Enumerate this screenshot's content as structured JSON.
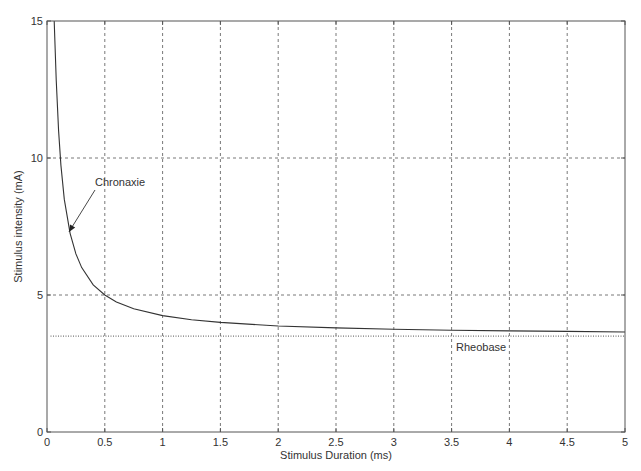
{
  "chart_data": {
    "type": "line",
    "title": "",
    "xlabel": "Stimulus Duration (ms)",
    "ylabel": "Stimulus intensity (mA)",
    "xlim": [
      0,
      5
    ],
    "ylim": [
      0,
      15
    ],
    "xticks": [
      0,
      0.5,
      1,
      1.5,
      2,
      2.5,
      3,
      3.5,
      4,
      4.5,
      5
    ],
    "xtick_labels": [
      "0",
      "0.5",
      "1",
      "1.5",
      "2",
      "2.5",
      "3",
      "3.5",
      "4",
      "4.5",
      "5"
    ],
    "yticks": [
      0,
      5,
      10,
      15
    ],
    "ytick_labels": [
      "0",
      "5",
      "10",
      "15"
    ],
    "grid": true,
    "grid_style": "dashed",
    "legend": null,
    "series": [
      {
        "name": "Strength-duration curve",
        "style": "solid",
        "color": "#333333",
        "x": [
          0.0625,
          0.08,
          0.1,
          0.12,
          0.15,
          0.2,
          0.25,
          0.3,
          0.4,
          0.5,
          0.6,
          0.75,
          1.0,
          1.25,
          1.5,
          2.0,
          2.5,
          3.0,
          3.5,
          4.0,
          4.5,
          5.0
        ],
        "y": [
          15.0,
          12.86,
          10.99,
          9.74,
          8.49,
          7.25,
          6.5,
          6.0,
          5.37,
          5.0,
          4.75,
          4.5,
          4.25,
          4.1,
          4.0,
          3.87,
          3.8,
          3.75,
          3.71,
          3.69,
          3.67,
          3.65
        ]
      },
      {
        "name": "Rheobase",
        "style": "dotted",
        "color": "#555555",
        "x": [
          0.03,
          5.0
        ],
        "y": [
          3.5,
          3.5
        ]
      }
    ],
    "annotations": [
      {
        "text": "Chronaxie",
        "arrow_to": [
          0.19,
          7.3
        ],
        "text_at": [
          0.5,
          8.9
        ]
      },
      {
        "text": "Rheobase",
        "text_at": [
          3.55,
          3.0
        ]
      }
    ]
  },
  "labels": {
    "chronaxie": "Chronaxie",
    "rheobase": "Rheobase"
  }
}
